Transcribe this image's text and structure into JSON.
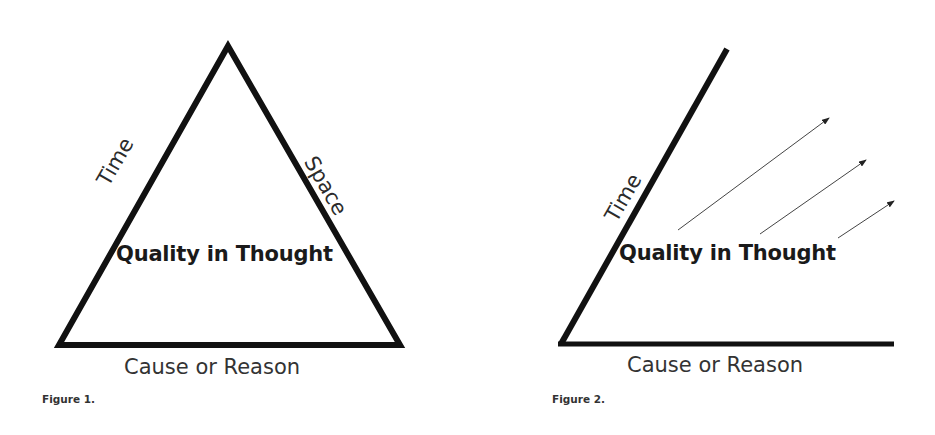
{
  "figure1": {
    "caption": "Figure 1.",
    "shape": "triangle",
    "left_side_label": "Time",
    "right_side_label": "Space",
    "center_label": "Quality in Thought",
    "base_label": "Cause or Reason"
  },
  "figure2": {
    "caption": "Figure 2.",
    "shape": "open-angle",
    "left_side_label": "Time",
    "center_label": "Quality in Thought",
    "base_label": "Cause or Reason",
    "arrow_count": 3
  },
  "colors": {
    "line": "#111111",
    "text": "#2b2b2b",
    "background": "#ffffff"
  }
}
